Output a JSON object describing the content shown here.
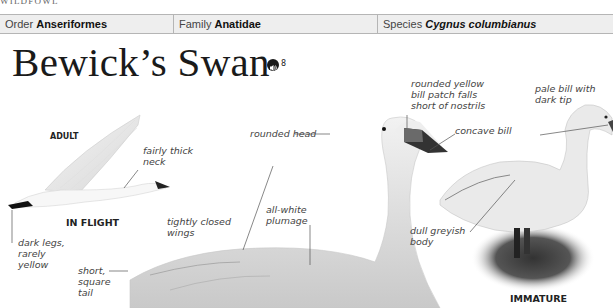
{
  "running_head": "WILDFOWL",
  "taxonomy": {
    "order_label": "Order",
    "order_value": "Anseriformes",
    "family_label": "Family",
    "family_value": "Anatidae",
    "species_label": "Species",
    "species_value": "Cygnus columbianus"
  },
  "title": "Bewick’s Swan",
  "audio": {
    "icon": "speaker-icon",
    "track_number": "8"
  },
  "captions": {
    "adult": "ADULT",
    "in_flight": "IN FLIGHT",
    "immature": "IMMATURE"
  },
  "labels": {
    "fairly_thick_neck_1": "fairly thick",
    "fairly_thick_neck_2": "neck",
    "dark_legs_1": "dark legs,",
    "dark_legs_2": "rarely",
    "dark_legs_3": "yellow",
    "tightly_closed_1": "tightly closed",
    "tightly_closed_2": "wings",
    "short_tail_1": "short,",
    "short_tail_2": "square",
    "short_tail_3": "tail",
    "all_white_1": "all-white",
    "all_white_2": "plumage",
    "rounded_head": "rounded head",
    "bill_patch_1": "rounded yellow",
    "bill_patch_2": "bill patch falls",
    "bill_patch_3": "short of nostrils",
    "concave_bill": "concave bill",
    "pale_bill_1": "pale bill with",
    "pale_bill_2": "dark tip",
    "dull_body_1": "dull greyish",
    "dull_body_2": "body"
  }
}
